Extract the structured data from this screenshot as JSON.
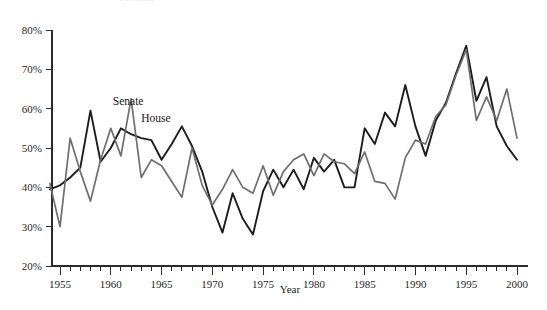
{
  "figure": {
    "clipped_top_title": "FIGURE"
  },
  "axes": {
    "y_title": "",
    "x_title": "Year",
    "y_ticks": [
      "20%",
      "30%",
      "40%",
      "50%",
      "60%",
      "70%",
      "80%"
    ],
    "x_ticks": [
      "1955",
      "1960",
      "1965",
      "1970",
      "1975",
      "1980",
      "1985",
      "1990",
      "1995",
      "2000"
    ]
  },
  "labels": {
    "senate": "Senate",
    "house": "House"
  },
  "colors": {
    "house_line": "#1c1c1c",
    "senate_line": "#6e6e6e",
    "axis": "#2b2b2b",
    "background": "#ffffff"
  },
  "chart_data": {
    "type": "line",
    "title": "",
    "xlabel": "Year",
    "ylabel": "",
    "xlim": [
      1954,
      2000
    ],
    "ylim": [
      20,
      80
    ],
    "y_tick_values": [
      20,
      30,
      40,
      50,
      60,
      70,
      80
    ],
    "y_tick_labels": [
      "20%",
      "30%",
      "40%",
      "50%",
      "60%",
      "70%",
      "80%"
    ],
    "x_tick_values": [
      1955,
      1960,
      1965,
      1970,
      1975,
      1980,
      1985,
      1990,
      1995,
      2000
    ],
    "x_minor_tick_step": 1,
    "grid": false,
    "legend": "inline-annotations",
    "annotations": [
      {
        "text": "Senate",
        "x": 1960.2,
        "y": 61.0
      },
      {
        "text": "House",
        "x": 1963.0,
        "y": 56.5
      }
    ],
    "x": [
      1954,
      1955,
      1956,
      1957,
      1958,
      1959,
      1960,
      1961,
      1962,
      1963,
      1964,
      1965,
      1966,
      1967,
      1968,
      1969,
      1970,
      1971,
      1972,
      1973,
      1974,
      1975,
      1976,
      1977,
      1978,
      1979,
      1980,
      1981,
      1982,
      1983,
      1984,
      1985,
      1986,
      1987,
      1988,
      1989,
      1990,
      1991,
      1992,
      1993,
      1994,
      1995,
      1996,
      1997,
      1998,
      1999,
      2000
    ],
    "series": [
      {
        "name": "House",
        "color": "#1c1c1c",
        "values": [
          39.5,
          40.5,
          42.5,
          45.0,
          59.5,
          46.5,
          50.0,
          55.0,
          53.5,
          52.5,
          52.0,
          47.0,
          51.0,
          55.5,
          50.5,
          44.0,
          35.0,
          28.5,
          38.5,
          32.0,
          28.0,
          39.0,
          44.5,
          40.0,
          44.5,
          39.5,
          47.5,
          44.0,
          47.0,
          40.0,
          40.0,
          55.0,
          51.0,
          59.0,
          55.5,
          66.0,
          55.5,
          48.0,
          57.0,
          61.5,
          69.0,
          76.0,
          62.0,
          68.0,
          55.5,
          50.5,
          47.0
        ]
      },
      {
        "name": "Senate",
        "color": "#6e6e6e",
        "values": [
          41.0,
          30.0,
          52.5,
          44.0,
          36.5,
          47.0,
          55.0,
          48.0,
          62.5,
          42.5,
          47.0,
          45.5,
          41.5,
          37.5,
          50.0,
          40.5,
          35.5,
          39.5,
          44.5,
          40.0,
          38.5,
          45.5,
          38.0,
          44.0,
          47.0,
          48.5,
          43.0,
          48.5,
          46.5,
          46.0,
          43.5,
          49.0,
          41.5,
          41.0,
          37.0,
          47.5,
          52.0,
          51.0,
          58.0,
          61.0,
          68.5,
          75.0,
          57.0,
          63.0,
          57.0,
          65.0,
          52.5
        ]
      }
    ]
  }
}
